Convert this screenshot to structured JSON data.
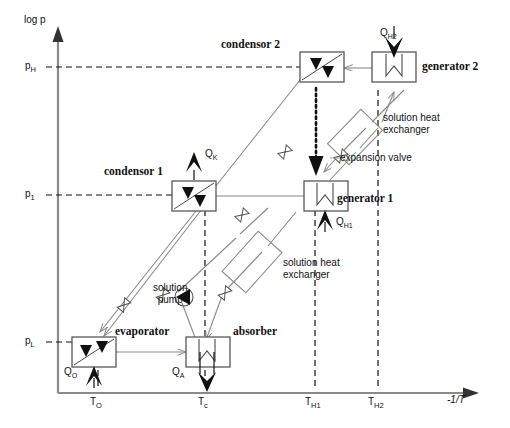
{
  "figure": {
    "type": "thermodynamic-cycle-diagram"
  },
  "axes": {
    "y_label": "log p",
    "x_label": "-1/T",
    "y_ticks": [
      {
        "id": "pH",
        "text": "p",
        "sub": "H",
        "y": 67
      },
      {
        "id": "p1",
        "text": "p",
        "sub": "1",
        "y": 195
      },
      {
        "id": "pL",
        "text": "p",
        "sub": "L",
        "y": 342
      }
    ],
    "x_ticks": [
      {
        "id": "TO",
        "text": "T",
        "sub": "O",
        "x": 98
      },
      {
        "id": "Tc",
        "text": "T",
        "sub": "c",
        "x": 205
      },
      {
        "id": "TH1",
        "text": "T",
        "sub": "H1",
        "x": 315
      },
      {
        "id": "TH2",
        "text": "T",
        "sub": "H2",
        "x": 378
      }
    ]
  },
  "components": {
    "condensor2": {
      "label": "condensor 2",
      "kind": "condenser"
    },
    "generator2": {
      "label": "generator 2",
      "kind": "generator"
    },
    "condensor1": {
      "label": "condensor 1",
      "kind": "condenser"
    },
    "generator1": {
      "label": "generator 1",
      "kind": "generator"
    },
    "evaporator": {
      "label": "evaporator",
      "kind": "evaporator"
    },
    "absorber": {
      "label": "absorber",
      "kind": "absorber"
    },
    "solution_pump": {
      "label_line1": "solution",
      "label_line2": "pump"
    },
    "shx_low": {
      "label_line1": "solution heat",
      "label_line2": "exchanger"
    },
    "shx_high": {
      "label_line1": "solution heat",
      "label_line2": "exchanger"
    },
    "expansion_valve": {
      "label": "expansion valve"
    }
  },
  "heat_flows": {
    "QH2": {
      "text": "Q",
      "sub": "H2",
      "direction": "in"
    },
    "QH1": {
      "text": "Q",
      "sub": "H1",
      "direction": "in"
    },
    "QK": {
      "text": "Q",
      "sub": "K",
      "direction": "out"
    },
    "QO": {
      "text": "Q",
      "sub": "O",
      "direction": "in"
    },
    "QA": {
      "text": "Q",
      "sub": "A",
      "direction": "out"
    }
  },
  "colors": {
    "line": "#8a8a8a",
    "stroke_dark": "#1a1a1a",
    "text": "#111111",
    "background": "#ffffff"
  }
}
